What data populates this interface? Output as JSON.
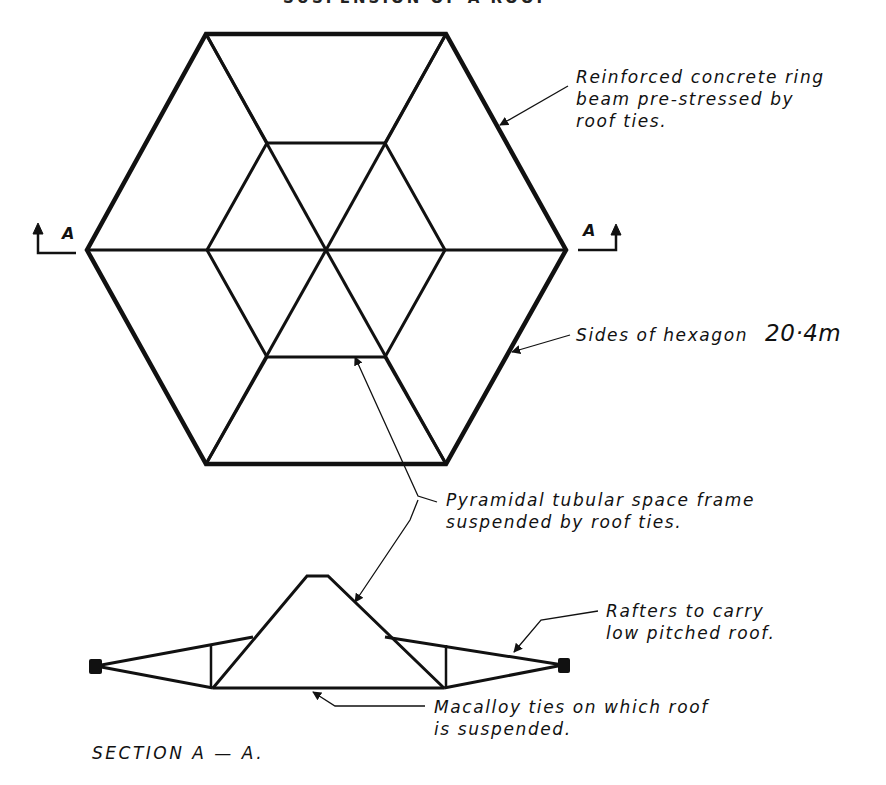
{
  "heading_partial": "SUSPENSION OF A ROOF",
  "plan": {
    "section_marker_left": "A",
    "section_marker_right": "A",
    "outer_hexagon": [
      [
        206,
        34
      ],
      [
        446,
        34
      ],
      [
        566,
        250
      ],
      [
        446,
        464
      ],
      [
        206,
        464
      ],
      [
        87,
        250
      ]
    ],
    "inner_hexagon": [
      [
        267,
        143
      ],
      [
        385,
        143
      ],
      [
        445,
        250
      ],
      [
        385,
        357
      ],
      [
        267,
        357
      ],
      [
        207,
        250
      ]
    ],
    "center": [
      326,
      250
    ]
  },
  "labels": {
    "ring_beam": [
      "Reinforced concrete ring",
      "beam pre-stressed by",
      "roof ties."
    ],
    "hexagon_sides_text": "Sides of hexagon",
    "hexagon_sides_value": "20·4m",
    "space_frame": [
      "Pyramidal tubular space frame",
      "suspended by roof ties."
    ],
    "rafters": [
      "Rafters to carry",
      "low pitched roof."
    ],
    "macalloy": [
      "Macalloy ties on which roof",
      "is suspended."
    ],
    "section_title": "SECTION A — A."
  },
  "colors": {
    "ink": "#111111",
    "paper": "#ffffff"
  }
}
